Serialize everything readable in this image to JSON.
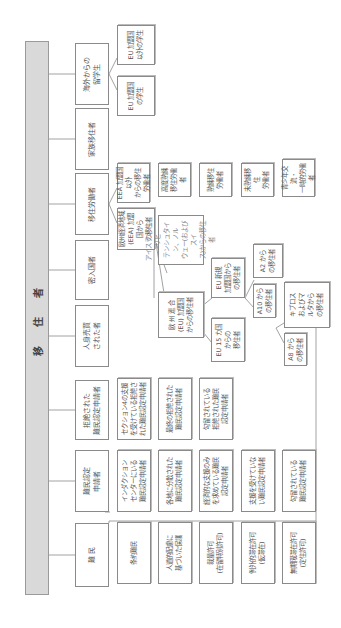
{
  "title": "移 住 者",
  "categories": [
    {
      "label": "難 民",
      "children": [
        "条約難民",
        "人道的配慮に\n基づいた保護",
        "裁量許可\n(在留特別許可)",
        "例外的滞在許可\n(仮滞在)",
        "無期限滞在許可\n(定住許可)"
      ]
    },
    {
      "label": "難民認定\n申請者",
      "children": [
        "インダクション\nセンターにいる\n難民認定申請者",
        "各地に分散された\n難民認定申請者",
        "経済的な支援のみ\nを求めている難民\n認定申請者",
        "支援を受けていな\nい難民認定申請者",
        "勾留されている\n難民認定申請者"
      ]
    },
    {
      "label": "拒絶された\n難民認定申請者",
      "children": [
        "セクション4の支援\nを受けている拒絶さ\nれた難民認定申請者",
        "最終の拒絶された\n難民認定申請者",
        "勾留されている\n拒絶された難民\n認定申請者"
      ]
    },
    {
      "label": "人身売買\nされた者",
      "children": []
    },
    {
      "label": "密入国者",
      "children": []
    },
    {
      "label": "移住労働者",
      "children": [
        "EEA 加盟国以外\nからの移住労働者",
        "欧州経済地域\n(EEA) 加盟国から\nの移住者"
      ],
      "eea_non_children": [
        "高度熟練\n移住労働者",
        "熟練移住\n労働者",
        "未熟練移住\n労働者",
        "青少年交流・\n一時的労働者"
      ],
      "eea_children": [
        "アイスランド、リヒ\nテンシュタイン、ノル\nウェー(およびスイ\nス)からの移住者",
        "欧 州 連 合\n(EU) 加盟国\nからの移住者"
      ],
      "eu_children": [
        "EU 新規\n加盟国から\nの移住者",
        "EU 15 カ国\nからの\n移住者"
      ],
      "eu_new_children": [
        "A2 から\nの移住者",
        "A10 から\nの移住者"
      ],
      "a10_children": [
        "キプロス\nおよびマ\nルタから\nの移住者",
        "A8 から\nの移住者"
      ]
    },
    {
      "label": "家族移住者",
      "children": []
    },
    {
      "label": "海外からの\n留学生",
      "children": [
        "EU 加盟国\n以外の学生",
        "EU 加盟国\nの学生"
      ]
    }
  ]
}
